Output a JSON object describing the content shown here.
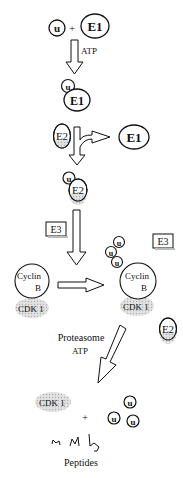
{
  "diagram": {
    "labels": {
      "ubiquitin": "u",
      "plus": "+",
      "e1": "E1",
      "e2": "E2",
      "e3": "E3",
      "atp": "ATP",
      "cyclin_line1": "Cyclin",
      "cyclin_line2": "B",
      "cdk1": "CDK 1",
      "proteasome": "Proteasome",
      "peptides": "Peptides"
    },
    "steps": [
      {
        "id": "activation",
        "description": "u + E1 -> u-E1",
        "cofactor": "ATP"
      },
      {
        "id": "transfer",
        "description": "u-E1 + E2 -> u-E2 + E1"
      },
      {
        "id": "ligation",
        "description": "u-E2 + E3 + Cyclin B/CDK1 -> polyubiquitinated Cyclin B/CDK1 + E3 + E2"
      },
      {
        "id": "degradation",
        "description": "Proteasome + ATP -> CDK 1 + u + u + u + Peptides"
      }
    ],
    "colors": {
      "stroke": "#111111",
      "cdk_fill": "#d6d6d6",
      "e2_shade": "#cfcfcf"
    }
  }
}
